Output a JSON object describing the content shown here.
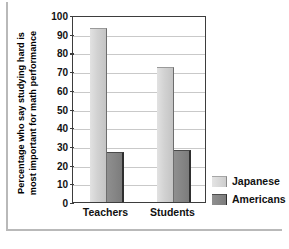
{
  "chart_data": {
    "type": "bar",
    "title": "",
    "xlabel": "",
    "ylabel": "Percentage who say studying hard is most important for math performance",
    "ylabel_line1": "Percentage who say studying hard is",
    "ylabel_line2": "most important for math performance",
    "categories": [
      "Teachers",
      "Students"
    ],
    "series": [
      {
        "name": "Japanese",
        "values": [
          93,
          72
        ],
        "color": "#d2d2d2"
      },
      {
        "name": "Americans",
        "values": [
          27,
          28
        ],
        "color": "#868686"
      }
    ],
    "ylim": [
      0,
      100
    ],
    "yticks": [
      0,
      10,
      20,
      30,
      40,
      50,
      60,
      70,
      80,
      90,
      100
    ],
    "ytick_labels": [
      "0",
      "10",
      "20",
      "30",
      "40",
      "50",
      "60",
      "70",
      "80",
      "90",
      "100"
    ],
    "grid": true,
    "legend_position": "right"
  }
}
